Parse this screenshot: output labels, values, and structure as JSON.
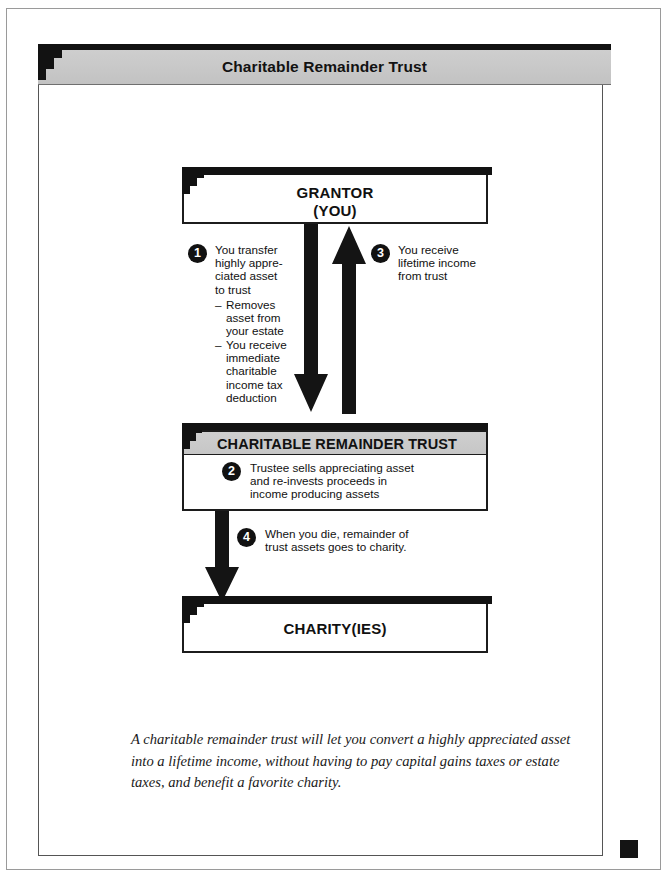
{
  "header": {
    "title": "Charitable Remainder Trust"
  },
  "nodes": {
    "grantor": {
      "line1": "GRANTOR",
      "line2": "(YOU)"
    },
    "trust": {
      "title": "CHARITABLE REMAINDER TRUST"
    },
    "charity": {
      "title": "CHARITY(IES)"
    }
  },
  "steps": [
    {
      "number": "1",
      "text": "You transfer highly appre-ciated asset to trust",
      "sub_items": [
        {
          "marker": "–",
          "text": "Removes\nasset from\nyour estate"
        },
        {
          "marker": "–",
          "text": "You receive\nimmediate\ncharitable\nincome tax\ndeduction"
        }
      ]
    },
    {
      "number": "2",
      "text": "Trustee sells appreciating asset and re-invests proceeds in income producing assets"
    },
    {
      "number": "3",
      "text": "You receive lifetime income from trust"
    },
    {
      "number": "4",
      "text": "When you die, remainder of trust assets goes to charity."
    }
  ],
  "arrows": [
    {
      "name": "grantor-to-trust",
      "direction": "down",
      "label_step": "1"
    },
    {
      "name": "trust-to-grantor",
      "direction": "up",
      "label_step": "3"
    },
    {
      "name": "trust-to-charity",
      "direction": "down",
      "label_step": "4"
    }
  ],
  "caption": "A charitable remainder trust will let you convert a highly appreciated asset into a lifetime income, without having to pay capital gains taxes or estate taxes, and benefit a favorite charity.",
  "colors": {
    "ink": "#111111",
    "banner_gray": "#c9c9c9",
    "frame_gray": "#555555",
    "paper": "#ffffff"
  }
}
